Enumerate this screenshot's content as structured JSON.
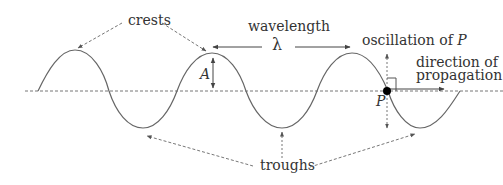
{
  "diagram": {
    "type": "transverse-wave",
    "colors": {
      "wave": "#666666",
      "text": "#333333",
      "dashed": "#777777",
      "arrow": "#555555",
      "point": "#000000"
    },
    "labels": {
      "crests": "crests",
      "wavelength": "wavelength",
      "lambda": "λ",
      "amplitude": "A",
      "oscillation": "oscillation of ",
      "oscillation_point": "P",
      "direction_line1": "direction of",
      "direction_line2": "propagation",
      "point": "P",
      "troughs": "troughs"
    }
  }
}
